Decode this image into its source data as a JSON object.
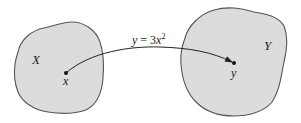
{
  "diagram": {
    "type": "function-mapping",
    "sets": [
      {
        "id": "domain",
        "label": "X",
        "fill": "#dcdcdc",
        "stroke": "#555555"
      },
      {
        "id": "codomain",
        "label": "Y",
        "fill": "#dcdcdc",
        "stroke": "#555555"
      }
    ],
    "points": [
      {
        "id": "x",
        "label": "x",
        "set": "X"
      },
      {
        "id": "y",
        "label": "y",
        "set": "Y"
      }
    ],
    "mapping": {
      "from": "x",
      "to": "y",
      "label_lhs": "y",
      "label_eq": " = 3",
      "label_var": "x",
      "label_exp": "2"
    }
  }
}
